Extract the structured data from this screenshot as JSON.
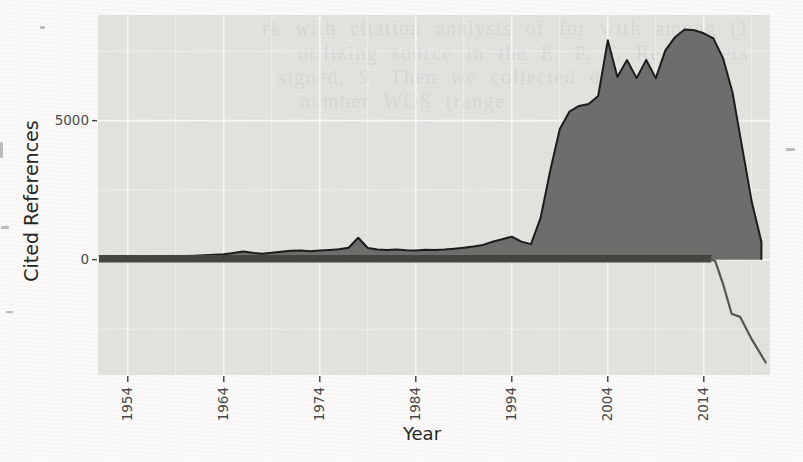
{
  "page": {
    "bleedthrough_lines": [
      {
        "text": "rk with citation analysis of for with among (1",
        "x": 262,
        "y": 17
      },
      {
        "text": "utilizing source in the E. P. F. Researchers",
        "x": 298,
        "y": 42
      },
      {
        "text": "signed, 9. Then we collected data from",
        "x": 278,
        "y": 66
      },
      {
        "text": "number WOS (range",
        "x": 300,
        "y": 90
      }
    ],
    "artifacts": [
      {
        "x": 0,
        "y": 142,
        "w": 3,
        "h": 16
      },
      {
        "x": 1,
        "y": 226,
        "w": 8,
        "h": 3
      },
      {
        "x": 40,
        "y": 26,
        "w": 5,
        "h": 3
      },
      {
        "x": 786,
        "y": 148,
        "w": 9,
        "h": 3
      },
      {
        "x": 6,
        "y": 311,
        "w": 7,
        "h": 2
      }
    ]
  },
  "chart_data": {
    "type": "area",
    "title": "",
    "xlabel": "Year",
    "ylabel": "Cited References",
    "x_ticks": [
      1954,
      1964,
      1974,
      1984,
      1994,
      2004,
      2014
    ],
    "y_ticks": [
      0,
      5000
    ],
    "xlim": [
      1950.9,
      2020.9
    ],
    "ylim": [
      -4150,
      8800
    ],
    "grid": "ggplot-style gray panel with white major/minor gridlines",
    "legend": "none",
    "x_minor_ticks": [
      1959,
      1969,
      1979,
      1989,
      1999,
      2009,
      2019
    ],
    "y_minor_ticks": [
      -2500,
      2500,
      7500
    ],
    "series": [
      {
        "name": "Cited References",
        "style": "filled gray area with dark outline",
        "years": [
          1951,
          1952,
          1953,
          1954,
          1955,
          1956,
          1957,
          1958,
          1959,
          1960,
          1961,
          1962,
          1963,
          1964,
          1965,
          1966,
          1967,
          1968,
          1969,
          1970,
          1971,
          1972,
          1973,
          1974,
          1975,
          1976,
          1977,
          1978,
          1979,
          1980,
          1981,
          1982,
          1983,
          1984,
          1985,
          1986,
          1987,
          1988,
          1989,
          1990,
          1991,
          1992,
          1993,
          1994,
          1995,
          1996,
          1997,
          1998,
          1999,
          2000,
          2001,
          2002,
          2003,
          2004,
          2005,
          2006,
          2007,
          2008,
          2009,
          2010,
          2011,
          2012,
          2013,
          2014,
          2015,
          2016,
          2017,
          2018,
          2019,
          2020
        ],
        "values": [
          40,
          50,
          55,
          65,
          70,
          75,
          90,
          100,
          110,
          130,
          140,
          160,
          175,
          195,
          240,
          290,
          245,
          215,
          245,
          280,
          320,
          330,
          305,
          330,
          350,
          370,
          430,
          785,
          420,
          365,
          350,
          360,
          340,
          330,
          355,
          345,
          365,
          395,
          430,
          470,
          530,
          640,
          730,
          830,
          650,
          560,
          1500,
          3200,
          4700,
          5320,
          5530,
          5600,
          5890,
          7890,
          6570,
          7180,
          6530,
          7180,
          6530,
          7530,
          8000,
          8280,
          8250,
          8140,
          7960,
          7250,
          6000,
          4030,
          2070,
          640
        ]
      },
      {
        "name": "Deviation line",
        "style": "thick dark line hugging zero, then thin line descending below axis after 2015",
        "near_zero_from": 1951,
        "near_zero_until": 2014.8,
        "descent_points": [
          [
            2014.8,
            0
          ],
          [
            2015.2,
            -60
          ],
          [
            2016,
            -870
          ],
          [
            2016.9,
            -1950
          ],
          [
            2017.8,
            -2060
          ],
          [
            2019,
            -2870
          ],
          [
            2020.5,
            -3730
          ]
        ]
      }
    ],
    "colors": {
      "page_bg": "#fbfaf8",
      "panel_bg": "#e8e7e4",
      "gridline": "#ffffff",
      "area_fill": "#6e6d6b",
      "area_outline": "#1c1c1c",
      "deviation_band": "#45443f",
      "deviation_thin": "#56554f",
      "tick_label": "#4a4a4a",
      "axis_title": "#262626"
    }
  }
}
